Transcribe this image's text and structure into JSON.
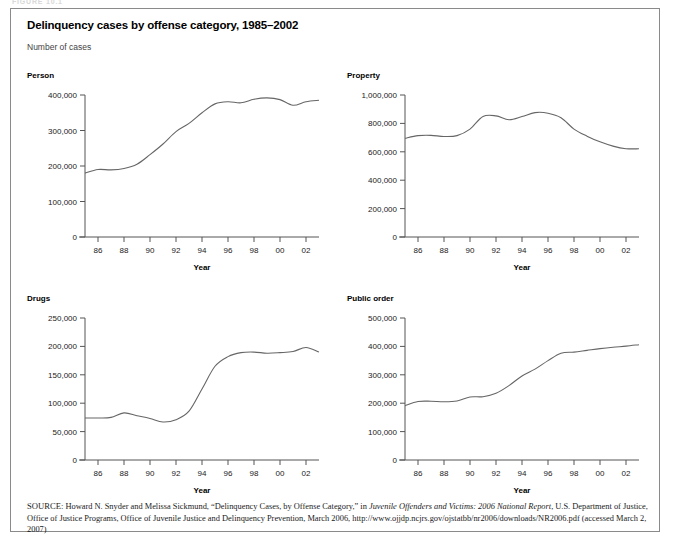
{
  "figure_label": "FIGURE 10.1",
  "panel": {
    "title": "Delinquency cases by offense category, 1985–2002",
    "subtitle": "Number of cases"
  },
  "source": {
    "prefix": "SOURCE:",
    "part1": " Howard N. Snyder and Melissa Sickmund, “Delinquency Cases, by Offense Category,” in ",
    "italic1": "Juvenile Offenders and Victims: 2006 National Report",
    "part2": ", U.S. Department of Justice, Office of Justice Programs, Office of Juvenile Justice and Delinquency Prevention, March 2006, http://www.ojjdp.ncjrs.gov/ojstatbb/nr2006/downloads/NR2006.pdf (accessed March 2, 2007)"
  },
  "axis_label_year": "Year",
  "chart_data": [
    {
      "type": "line",
      "title": "Person",
      "xlabel": "Year",
      "ylabel": "",
      "xlim": [
        1985,
        2003
      ],
      "ylim": [
        0,
        400000
      ],
      "yticks": [
        0,
        100000,
        200000,
        300000,
        400000
      ],
      "ytick_labels": [
        "0",
        "100,000",
        "200,000",
        "300,000",
        "400,000"
      ],
      "xticks": [
        1986,
        1988,
        1990,
        1992,
        1994,
        1996,
        1998,
        2000,
        2002
      ],
      "xtick_labels": [
        "86",
        "88",
        "90",
        "92",
        "94",
        "96",
        "98",
        "00",
        "02"
      ],
      "grid": false,
      "legend": "none",
      "x": [
        1985,
        1986,
        1987,
        1988,
        1989,
        1990,
        1991,
        1992,
        1993,
        1994,
        1995,
        1996,
        1997,
        1998,
        1999,
        2000,
        2001,
        2002,
        2003
      ],
      "values": [
        180000,
        190000,
        189000,
        193000,
        205000,
        232000,
        262000,
        297000,
        320000,
        350000,
        375000,
        381000,
        378000,
        388000,
        392000,
        387000,
        371000,
        381000,
        385000
      ]
    },
    {
      "type": "line",
      "title": "Property",
      "xlabel": "Year",
      "ylabel": "",
      "xlim": [
        1985,
        2003
      ],
      "ylim": [
        0,
        1000000
      ],
      "yticks": [
        0,
        200000,
        400000,
        600000,
        800000,
        1000000
      ],
      "ytick_labels": [
        "0",
        "200,000",
        "400,000",
        "600,000",
        "800,000",
        "1,000,000"
      ],
      "xticks": [
        1986,
        1988,
        1990,
        1992,
        1994,
        1996,
        1998,
        2000,
        2002
      ],
      "xtick_labels": [
        "86",
        "88",
        "90",
        "92",
        "94",
        "96",
        "98",
        "00",
        "02"
      ],
      "grid": false,
      "legend": "none",
      "x": [
        1985,
        1986,
        1987,
        1988,
        1989,
        1990,
        1991,
        1992,
        1993,
        1994,
        1995,
        1996,
        1997,
        1998,
        1999,
        2000,
        2001,
        2002,
        2003
      ],
      "values": [
        695000,
        714000,
        716000,
        708000,
        714000,
        760000,
        849000,
        853000,
        826000,
        848000,
        876000,
        872000,
        840000,
        760000,
        710000,
        670000,
        640000,
        622000,
        621000
      ]
    },
    {
      "type": "line",
      "title": "Drugs",
      "xlabel": "Year",
      "ylabel": "",
      "xlim": [
        1985,
        2003
      ],
      "ylim": [
        0,
        250000
      ],
      "yticks": [
        0,
        50000,
        100000,
        150000,
        200000,
        250000
      ],
      "ytick_labels": [
        "0",
        "50,000",
        "100,000",
        "150,000",
        "200,000",
        "250,000"
      ],
      "xticks": [
        1986,
        1988,
        1990,
        1992,
        1994,
        1996,
        1998,
        2000,
        2002
      ],
      "xtick_labels": [
        "86",
        "88",
        "90",
        "92",
        "94",
        "96",
        "98",
        "00",
        "02"
      ],
      "grid": false,
      "legend": "none",
      "x": [
        1985,
        1986,
        1987,
        1988,
        1989,
        1990,
        1991,
        1992,
        1993,
        1994,
        1995,
        1996,
        1997,
        1998,
        1999,
        2000,
        2001,
        2002,
        2003
      ],
      "values": [
        74000,
        74000,
        75000,
        83000,
        78000,
        73000,
        67000,
        71000,
        86000,
        125000,
        165000,
        182000,
        189000,
        190000,
        188000,
        189000,
        191000,
        198000,
        190000
      ]
    },
    {
      "type": "line",
      "title": "Public order",
      "xlabel": "Year",
      "ylabel": "",
      "xlim": [
        1985,
        2003
      ],
      "ylim": [
        0,
        500000
      ],
      "yticks": [
        0,
        100000,
        200000,
        300000,
        400000,
        500000
      ],
      "ytick_labels": [
        "0",
        "100,000",
        "200,000",
        "300,000",
        "400,000",
        "500,000"
      ],
      "xticks": [
        1986,
        1988,
        1990,
        1992,
        1994,
        1996,
        1998,
        2000,
        2002
      ],
      "xtick_labels": [
        "86",
        "88",
        "90",
        "92",
        "94",
        "96",
        "98",
        "00",
        "02"
      ],
      "grid": false,
      "legend": "none",
      "x": [
        1985,
        1986,
        1987,
        1988,
        1989,
        1990,
        1991,
        1992,
        1993,
        1994,
        1995,
        1996,
        1997,
        1998,
        1999,
        2000,
        2001,
        2002,
        2003
      ],
      "values": [
        191000,
        206000,
        207000,
        205000,
        208000,
        222000,
        223000,
        235000,
        262000,
        296000,
        320000,
        350000,
        376000,
        380000,
        386000,
        392000,
        397000,
        401000,
        406000
      ]
    }
  ]
}
